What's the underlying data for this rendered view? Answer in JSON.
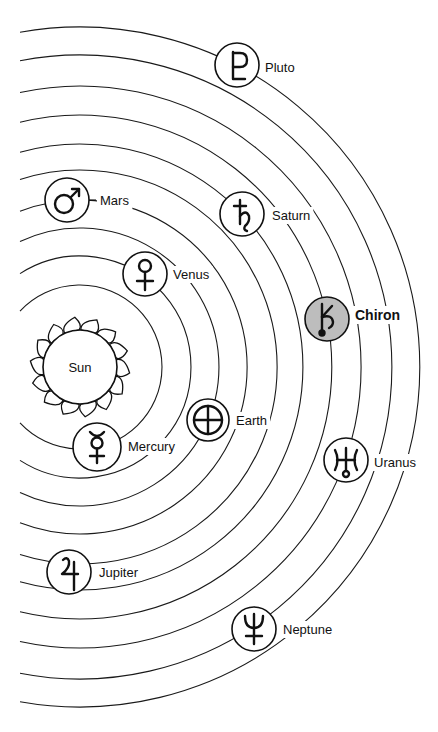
{
  "diagram": {
    "type": "solar-system-orbits",
    "sun": {
      "label": "Sun",
      "cx": 80,
      "cy": 367,
      "r": 37
    },
    "orbits": [
      82,
      111,
      139,
      167,
      197,
      223,
      252,
      281,
      312,
      340
    ],
    "planets": [
      {
        "name": "Mercury",
        "symbol": "mercury-symbol",
        "orbit": 1,
        "cx": 97,
        "cy": 447,
        "r": 24,
        "label_x": 128,
        "label_y": 451,
        "shade": "white"
      },
      {
        "name": "Venus",
        "symbol": "venus-symbol",
        "orbit": 2,
        "cx": 145,
        "cy": 274,
        "r": 22,
        "label_x": 173,
        "label_y": 279,
        "shade": "white"
      },
      {
        "name": "Earth",
        "symbol": "earth-symbol",
        "orbit": 3,
        "cx": 208,
        "cy": 420,
        "r": 21,
        "label_x": 236,
        "label_y": 425,
        "shade": "white"
      },
      {
        "name": "Mars",
        "symbol": "mars-symbol",
        "orbit": 4,
        "cx": 67,
        "cy": 200,
        "r": 22,
        "label_x": 100,
        "label_y": 205,
        "shade": "white"
      },
      {
        "name": "Jupiter",
        "symbol": "jupiter-symbol",
        "orbit": 5,
        "cx": 69,
        "cy": 572,
        "r": 22,
        "label_x": 99,
        "label_y": 577,
        "shade": "white"
      },
      {
        "name": "Saturn",
        "symbol": "saturn-symbol",
        "orbit": 6,
        "cx": 242,
        "cy": 214,
        "r": 22,
        "label_x": 272,
        "label_y": 220,
        "shade": "white"
      },
      {
        "name": "Chiron",
        "symbol": "chiron-symbol",
        "orbit": 7,
        "cx": 327,
        "cy": 319,
        "r": 22,
        "label_x": 355,
        "label_y": 320,
        "shade": "gray",
        "emphasis": "bold"
      },
      {
        "name": "Uranus",
        "symbol": "uranus-symbol",
        "orbit": 8,
        "cx": 346,
        "cy": 460,
        "r": 22,
        "label_x": 374,
        "label_y": 467,
        "shade": "white"
      },
      {
        "name": "Neptune",
        "symbol": "neptune-symbol",
        "orbit": 9,
        "cx": 254,
        "cy": 629,
        "r": 22,
        "label_x": 283,
        "label_y": 634,
        "shade": "white"
      },
      {
        "name": "Pluto",
        "symbol": "pluto-symbol",
        "orbit": 10,
        "cx": 237,
        "cy": 65,
        "r": 22,
        "label_x": 265,
        "label_y": 72,
        "shade": "white"
      }
    ],
    "colors": {
      "ink": "#111111",
      "background": "#ffffff",
      "chiron_fill": "#bdbdbd"
    }
  }
}
